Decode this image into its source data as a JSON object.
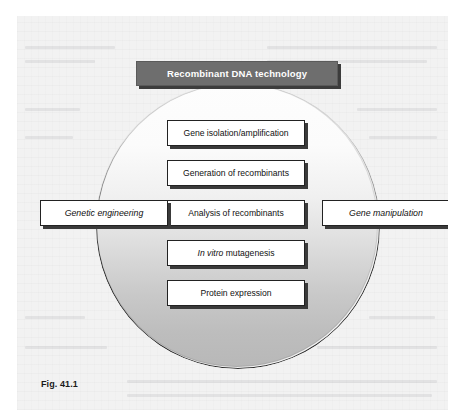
{
  "figure": {
    "caption": "Fig. 41.1",
    "header": {
      "label": "Recombinant DNA technology",
      "background_color": "#6e6e6e",
      "text_color": "#ffffff"
    },
    "circle": {
      "name": "gradient-sphere",
      "gradient_top_color": "#fdfdfd",
      "gradient_bottom_color": "#b8b8b8",
      "outline_color": "#2b2b2b"
    },
    "stages": [
      {
        "label": "Gene isolation/amplification",
        "italic_prefix": ""
      },
      {
        "label": "Generation of recombinants",
        "italic_prefix": ""
      },
      {
        "label": "Analysis of recombinants",
        "italic_prefix": ""
      },
      {
        "label": " mutagenesis",
        "italic_prefix": "In vitro"
      },
      {
        "label": "Protein expression",
        "italic_prefix": ""
      }
    ],
    "side_terms": {
      "left": "Genetic engineering",
      "right": "Gene manipulation"
    },
    "panel": {
      "background_color": "#f2f2f2",
      "box_fill_color": "#ffffff",
      "box_border_color": "#222222",
      "box_shadow_color": "#3a3a3a"
    }
  }
}
